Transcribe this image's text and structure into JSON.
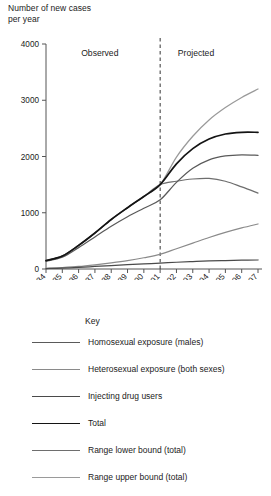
{
  "axis_title": "Number of new cases\nper year",
  "axis_title_line1": "Number of new cases",
  "axis_title_line2": "per year",
  "regions": {
    "observed": "Observed",
    "projected": "Projected"
  },
  "legend": {
    "title": "Key",
    "items": [
      {
        "label": "Homosexual exposure (males)",
        "color": "#5a5a5a"
      },
      {
        "label": "Heterosexual exposure (both sexes)",
        "color": "#8a8a8a"
      },
      {
        "label": "Injecting drug users",
        "color": "#4a4a4a"
      },
      {
        "label": "Total",
        "color": "#141414"
      },
      {
        "label": "Range lower bound (total)",
        "color": "#6e6e6e"
      },
      {
        "label": "Range upper bound (total)",
        "color": "#9a9a9a"
      }
    ]
  },
  "chart_data": {
    "type": "line",
    "title": "",
    "subtitle": "",
    "xlabel": "",
    "ylabel": "Number of new cases per year",
    "ylim": [
      0,
      4000
    ],
    "yticks": [
      0,
      1000,
      2000,
      3000,
      4000
    ],
    "ytick_labels": [
      "0",
      "1000",
      "2000",
      "3000",
      "4000"
    ],
    "grid": false,
    "legend_position": "below",
    "x": [
      1984,
      1985,
      1986,
      1987,
      1988,
      1989,
      1990,
      1991,
      1992,
      1993,
      1994,
      1995,
      1996,
      1997
    ],
    "categories": [
      "1984",
      "1985",
      "1986",
      "1987",
      "1988",
      "1989",
      "1990",
      "1991",
      "1992",
      "1993",
      "1994",
      "1995",
      "1996",
      "1997"
    ],
    "annotations": [
      {
        "text": "Observed",
        "x": 1987.3,
        "y": 3780
      },
      {
        "text": "Projected",
        "x": 1993.2,
        "y": 3780
      },
      {
        "text": "divider",
        "type": "vline",
        "x": 1991,
        "style": "dashed"
      }
    ],
    "series": [
      {
        "name": "Total",
        "color": "#141414",
        "values": [
          150,
          230,
          420,
          640,
          880,
          1090,
          1290,
          1500,
          1870,
          2140,
          2310,
          2400,
          2430,
          2430
        ]
      },
      {
        "name": "Homosexual exposure (males)",
        "color": "#5a5a5a",
        "values": [
          140,
          210,
          380,
          570,
          760,
          930,
          1080,
          1230,
          1540,
          1790,
          1940,
          2010,
          2030,
          2020
        ]
      },
      {
        "name": "Heterosexual exposure (both sexes)",
        "color": "#8a8a8a",
        "values": [
          10,
          25,
          45,
          75,
          110,
          150,
          200,
          260,
          360,
          460,
          560,
          650,
          730,
          800
        ]
      },
      {
        "name": "Injecting drug users",
        "color": "#4a4a4a",
        "values": [
          8,
          15,
          28,
          45,
          62,
          78,
          92,
          105,
          120,
          132,
          143,
          150,
          156,
          160
        ]
      },
      {
        "name": "Range lower bound (total)",
        "color": "#6e6e6e",
        "values": [
          150,
          230,
          420,
          640,
          880,
          1090,
          1290,
          1500,
          1560,
          1600,
          1610,
          1560,
          1460,
          1350
        ]
      },
      {
        "name": "Range upper bound (total)",
        "color": "#9a9a9a",
        "values": [
          150,
          230,
          420,
          640,
          880,
          1090,
          1290,
          1500,
          1990,
          2360,
          2650,
          2870,
          3050,
          3200
        ]
      }
    ]
  }
}
